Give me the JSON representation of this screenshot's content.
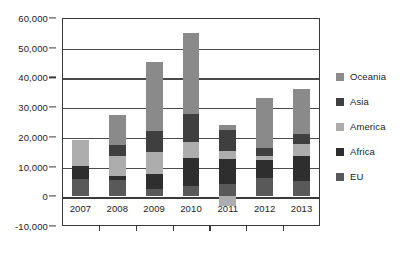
{
  "chart_data": {
    "type": "bar",
    "subtype": "stacked-bar",
    "title": "",
    "xlabel": "",
    "ylabel": "",
    "categories": [
      "2007",
      "2008",
      "2009",
      "2010",
      "2011",
      "2012",
      "2013"
    ],
    "ylim": [
      -10000,
      60000
    ],
    "ytick_values": [
      -10000,
      0,
      10000,
      20000,
      30000,
      40000,
      50000,
      60000
    ],
    "ytick_labels": [
      "-10,000",
      "0",
      "10,000",
      "20,000",
      "30,000",
      "40,000",
      "50,000",
      "60,000"
    ],
    "grid": true,
    "legend_position": "right",
    "series": [
      {
        "name": "EU",
        "color": "#595959",
        "values": [
          5900,
          5500,
          2500,
          3400,
          4200,
          6000,
          5100
        ]
      },
      {
        "name": "Africa",
        "color": "#2e2e2e",
        "values": [
          4300,
          1200,
          4900,
          9600,
          8300,
          6100,
          8300
        ]
      },
      {
        "name": "America",
        "color": "#adadad",
        "values": [
          8800,
          6900,
          7600,
          5200,
          2900,
          1500,
          4300
        ]
      },
      {
        "name": "Asia",
        "color": "#3f3f3f",
        "values": [
          0,
          3600,
          7000,
          9400,
          6900,
          2600,
          3200
        ]
      },
      {
        "name": "Oceania",
        "color": "#8a8a8a",
        "values": [
          0,
          10300,
          23300,
          27400,
          1800,
          16800,
          15100
        ]
      }
    ],
    "negative_segments": [
      {
        "category": "2011",
        "series": "Africa",
        "value": -3400,
        "color": "#adadad"
      }
    ],
    "totals": [
      19000,
      27500,
      45300,
      55000,
      24100,
      33000,
      36000
    ],
    "legend_entries": [
      "Oceania",
      "Asia",
      "America",
      "Africa",
      "EU"
    ]
  }
}
